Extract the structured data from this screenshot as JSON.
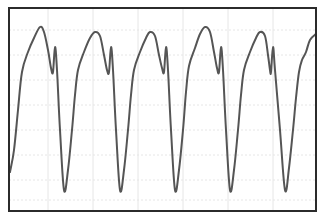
{
  "chart": {
    "title": "",
    "description": "Periodic waveform trace on a faint grid"
  },
  "style": {
    "background": "#ffffff",
    "frame_color": "#2b2b2b",
    "grid_color": "#e6e6e6",
    "trace_color": "#555555"
  },
  "chart_data": {
    "type": "line",
    "title": "",
    "xlabel": "",
    "ylabel": "",
    "grid": true,
    "legend": "none",
    "frame": {
      "x0": 9,
      "y0": 8,
      "x1": 316,
      "y1": 211
    },
    "grid_lines": {
      "vertical_px": [
        48,
        93,
        138,
        183,
        228,
        273
      ],
      "horizontal_px": [
        30,
        55,
        80,
        105,
        130,
        155,
        180,
        200
      ]
    },
    "cycles": 5.5,
    "series": [
      {
        "name": "waveform",
        "points_px": [
          [
            10,
            172
          ],
          [
            14,
            150
          ],
          [
            18,
            110
          ],
          [
            22,
            72
          ],
          [
            28,
            52
          ],
          [
            34,
            38
          ],
          [
            40,
            27
          ],
          [
            44,
            32
          ],
          [
            48,
            50
          ],
          [
            51,
            68
          ],
          [
            53,
            72
          ],
          [
            55,
            47
          ],
          [
            57,
            70
          ],
          [
            60,
            130
          ],
          [
            64,
            190
          ],
          [
            68,
            170
          ],
          [
            72,
            130
          ],
          [
            75,
            95
          ],
          [
            78,
            70
          ],
          [
            84,
            52
          ],
          [
            90,
            38
          ],
          [
            95,
            32
          ],
          [
            100,
            36
          ],
          [
            104,
            55
          ],
          [
            107,
            70
          ],
          [
            109,
            72
          ],
          [
            111,
            47
          ],
          [
            113,
            70
          ],
          [
            116,
            130
          ],
          [
            120,
            190
          ],
          [
            124,
            170
          ],
          [
            128,
            130
          ],
          [
            131,
            95
          ],
          [
            134,
            70
          ],
          [
            140,
            52
          ],
          [
            146,
            38
          ],
          [
            150,
            32
          ],
          [
            155,
            36
          ],
          [
            159,
            55
          ],
          [
            162,
            68
          ],
          [
            164,
            72
          ],
          [
            166,
            47
          ],
          [
            168,
            70
          ],
          [
            171,
            130
          ],
          [
            175,
            190
          ],
          [
            179,
            170
          ],
          [
            183,
            130
          ],
          [
            186,
            92
          ],
          [
            189,
            66
          ],
          [
            195,
            48
          ],
          [
            200,
            34
          ],
          [
            205,
            27
          ],
          [
            210,
            32
          ],
          [
            214,
            52
          ],
          [
            217,
            68
          ],
          [
            219,
            72
          ],
          [
            221,
            47
          ],
          [
            223,
            70
          ],
          [
            226,
            130
          ],
          [
            230,
            190
          ],
          [
            234,
            170
          ],
          [
            238,
            130
          ],
          [
            241,
            95
          ],
          [
            244,
            70
          ],
          [
            250,
            52
          ],
          [
            256,
            38
          ],
          [
            260,
            32
          ],
          [
            265,
            36
          ],
          [
            268,
            55
          ],
          [
            270,
            70
          ],
          [
            271,
            72
          ],
          [
            273,
            47
          ],
          [
            275,
            70
          ],
          [
            280,
            130
          ],
          [
            285,
            190
          ],
          [
            289,
            168
          ],
          [
            293,
            130
          ],
          [
            296,
            98
          ],
          [
            299,
            72
          ],
          [
            302,
            60
          ],
          [
            306,
            52
          ],
          [
            310,
            40
          ],
          [
            316,
            34
          ]
        ]
      }
    ],
    "peaks_px": [
      [
        40,
        27
      ],
      [
        95,
        32
      ],
      [
        150,
        32
      ],
      [
        205,
        27
      ],
      [
        260,
        32
      ]
    ],
    "notches_px": [
      [
        55,
        47
      ],
      [
        111,
        47
      ],
      [
        166,
        47
      ],
      [
        221,
        47
      ],
      [
        273,
        47
      ]
    ],
    "troughs_px": [
      [
        64,
        190
      ],
      [
        120,
        190
      ],
      [
        175,
        190
      ],
      [
        230,
        190
      ],
      [
        285,
        190
      ]
    ]
  }
}
